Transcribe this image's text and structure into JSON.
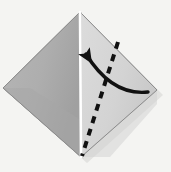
{
  "figure": {
    "title": "Origami valley-fold diagram",
    "canvas": {
      "width": 171,
      "height": 172
    },
    "colors": {
      "background": "#f4f4f2",
      "left_panel": "#aeaeae",
      "left_panel_shade": "#9b9b9b",
      "right_panel": "#d6d6d6",
      "right_panel_shade": "#c6c6c6",
      "edge_dark": "#6f6f6f",
      "edge_outline": "#8c8c8c",
      "center_crease": "#ffffff",
      "fold_line": "#111111",
      "arrow": "#111111"
    },
    "shape": {
      "name": "kite-diamond",
      "vertices": {
        "top": [
          80,
          12
        ],
        "left": [
          3,
          88
        ],
        "right": [
          157,
          90
        ],
        "bottom": [
          81,
          157
        ]
      }
    },
    "center_crease": {
      "name": "vertical-center-crease",
      "from": [
        80,
        12
      ],
      "to": [
        81,
        157
      ],
      "style": "solid-white"
    },
    "fold_line": {
      "name": "valley-fold-dashed-line",
      "from": [
        118,
        42
      ],
      "to": [
        82,
        156
      ],
      "style": "dashed",
      "dash_pattern": "7 6",
      "stroke_width": 4
    },
    "arrow": {
      "name": "fold-direction-arrow",
      "start": [
        148,
        92
      ],
      "control": [
        112,
        96
      ],
      "end": [
        86,
        54
      ],
      "head_at": [
        85,
        53
      ],
      "head_direction": "up-left",
      "stroke_width": 3.4,
      "style": "curved-solid-with-filled-head"
    },
    "thickness_edge": {
      "name": "paper-thickness-edge",
      "from": [
        4,
        90
      ],
      "to": [
        81,
        158
      ]
    },
    "labels": [],
    "step_number": ""
  }
}
